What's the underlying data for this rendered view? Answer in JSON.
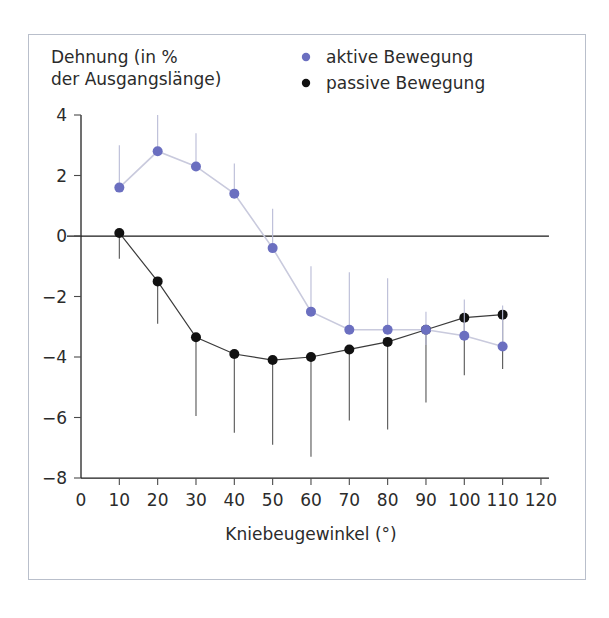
{
  "chart_data": {
    "type": "line",
    "title": "",
    "xlabel": "Kniebeugewinkel (°)",
    "ylabel_line1": "Dehnung (in %",
    "ylabel_line2": "der Ausgangslänge)",
    "x": [
      10,
      20,
      30,
      40,
      50,
      60,
      70,
      80,
      90,
      100,
      110
    ],
    "xlim": [
      0,
      120
    ],
    "ylim": [
      -8,
      4
    ],
    "xticks": [
      0,
      10,
      20,
      30,
      40,
      50,
      60,
      70,
      80,
      90,
      100,
      110,
      120
    ],
    "xtick_labels": [
      "0",
      "10",
      "20",
      "30",
      "40",
      "50",
      "60",
      "70",
      "80",
      "90",
      "100",
      "110",
      "120"
    ],
    "yticks": [
      4,
      2,
      0,
      -2,
      -4,
      -6,
      -8
    ],
    "ytick_labels": [
      "4",
      "2",
      "0",
      "−2",
      "−4",
      "−6",
      "−8"
    ],
    "grid": false,
    "zero_line": true,
    "legend_position": "top-right",
    "series": [
      {
        "name": "aktive Bewegung",
        "color": "#6b6fc0",
        "marker": "circle",
        "values": [
          1.6,
          2.8,
          2.3,
          1.4,
          -0.4,
          -2.5,
          -3.1,
          -3.1,
          -3.1,
          -3.3,
          -3.65
        ],
        "err_low": [
          1.6,
          2.8,
          2.3,
          1.4,
          -0.4,
          -2.5,
          -3.1,
          -3.1,
          -3.6,
          -3.3,
          -3.65
        ],
        "err_high": [
          3.0,
          4.0,
          3.4,
          2.4,
          0.9,
          -1.0,
          -1.2,
          -1.4,
          -2.5,
          -2.1,
          -2.3
        ]
      },
      {
        "name": "passive Bewegung",
        "color": "#111111",
        "marker": "circle",
        "values": [
          0.1,
          -1.5,
          -3.35,
          -3.9,
          -4.1,
          -4.0,
          -3.75,
          -3.5,
          -3.1,
          -2.7,
          -2.6
        ],
        "err_low": [
          -0.75,
          -2.9,
          -5.95,
          -6.5,
          -6.9,
          -7.3,
          -6.1,
          -6.4,
          -5.5,
          -4.6,
          -4.4
        ],
        "err_high": [
          0.1,
          -1.5,
          -3.35,
          -3.9,
          -4.1,
          -4.0,
          -3.75,
          -3.5,
          -3.1,
          -2.7,
          -2.6
        ]
      }
    ]
  },
  "legend": {
    "items": [
      {
        "label": "aktive Bewegung",
        "color": "#6b6fc0"
      },
      {
        "label": "passive Bewegung",
        "color": "#111111"
      }
    ]
  },
  "colors": {
    "active": "#6b6fc0",
    "passive": "#111111",
    "frame": "#b9bfcb",
    "axis": "#1a1a1a",
    "active_line": "#c9cadd"
  }
}
